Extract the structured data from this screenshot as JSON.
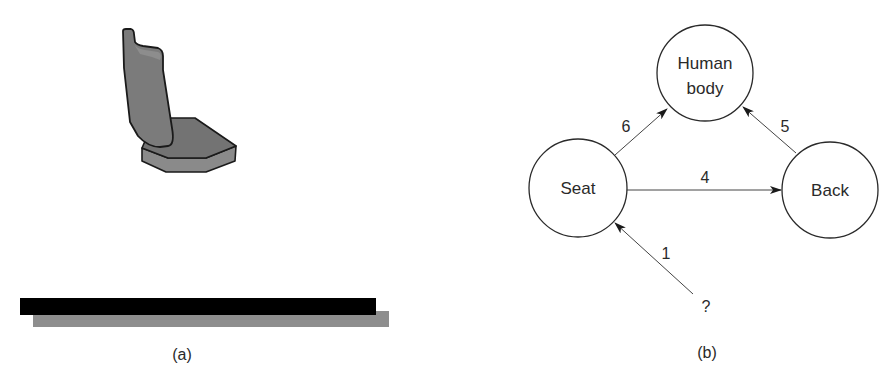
{
  "panel_a": {
    "caption": "(a)",
    "illustration": "seat-with-backrest",
    "colors": {
      "seat_fill": "#7a7a7a",
      "seat_side": "#8c8c8c",
      "backrest_fill": "#7d7d7d",
      "outline": "#1a1a1a",
      "floor_top": "#000000",
      "floor_shadow": "#8e8e8e"
    }
  },
  "panel_b": {
    "caption": "(b)",
    "nodes": {
      "seat": {
        "label": "Seat"
      },
      "human_body": {
        "label_line1": "Human",
        "label_line2": "body"
      },
      "back": {
        "label": "Back"
      }
    },
    "edges": [
      {
        "from": "Seat",
        "to": "Back",
        "label": "4"
      },
      {
        "from": "Seat",
        "to": "Human body",
        "label": "6"
      },
      {
        "from": "Back",
        "to": "Human body",
        "label": "5"
      },
      {
        "from": "?",
        "to": "Seat",
        "label": "1"
      }
    ],
    "source_node": {
      "label": "?"
    }
  }
}
